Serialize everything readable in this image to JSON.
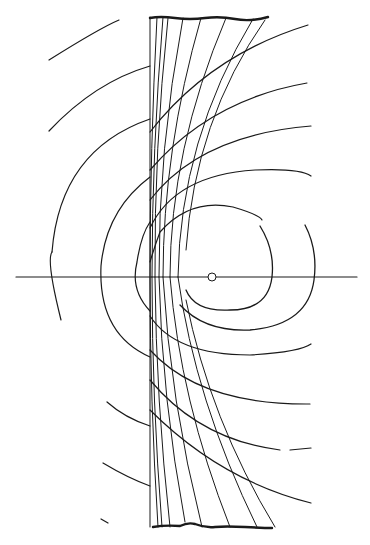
{
  "figure": {
    "type": "line-drawing",
    "background": "#ffffff",
    "ink": "#1a1a1a",
    "axis": {
      "y": 277,
      "x_start": 16,
      "x_end": 357
    },
    "source": {
      "cx": 212,
      "cy": 277,
      "r": 4
    },
    "plate": {
      "x_left": 150,
      "top_y": 17,
      "bottom_y": 527,
      "top_right_x": 268,
      "bottom_right_x": 272
    },
    "left_arcs": [
      {
        "d": "M49 60 Q100 28 119 20"
      },
      {
        "d": "M49 131 Q95 82 150 66"
      },
      {
        "d": "M52 252 Q60 150 150 119"
      },
      {
        "d": "M61 320 Q46 260 52 252"
      },
      {
        "d": "M150 357 Q98 334 101 266 Q106 210 150 177"
      },
      {
        "d": "M150 311 Q130 290 137 262 Q141 235 150 222"
      },
      {
        "d": "M107 402 Q125 418 150 426"
      },
      {
        "d": "M103 463 Q128 478 150 486"
      },
      {
        "d": "M101 519 L108 523"
      }
    ],
    "right_arcs": [
      {
        "d": "M150 262 Q155 245 160 232 Q190 198 233 207 Q260 215 262 220"
      },
      {
        "d": "M150 228 Q175 175 255 170 Q300 168 311 176"
      },
      {
        "d": "M150 200 Q200 135 311 126"
      },
      {
        "d": "M150 170 Q210 100 307 83"
      },
      {
        "d": "M150 132 Q210 55 308 25"
      },
      {
        "d": "M150 316 Q175 355 250 355 Q300 352 311 344"
      },
      {
        "d": "M150 350 Q200 405 310 404"
      },
      {
        "d": "M150 380 Q200 440 280 450"
      },
      {
        "d": "M290 450 L311 448"
      },
      {
        "d": "M150 410 Q220 480 311 503"
      }
    ],
    "near_circles": [
      {
        "cx": 212,
        "cy": 277,
        "rx": 33,
        "ry": 30
      },
      {
        "d": "M260 226 Q275 250 272 277 Q268 310 230 310 Q195 312 186 290"
      },
      {
        "d": "M305 225 Q318 250 314 280 Q308 325 250 330 Q205 332 180 305"
      }
    ],
    "plate_lines": [
      {
        "d": "M150 17 L150 527"
      },
      {
        "d": "M157 17 Q150 150 150 277 Q150 400 158 527"
      },
      {
        "d": "M163 17 Q152 150 152 277"
      },
      {
        "d": "M168 18 Q154 150 155 277"
      },
      {
        "d": "M183 18 Q158 150 159 277"
      },
      {
        "d": "M201 18 Q163 150 163 277"
      },
      {
        "d": "M226 18 Q170 150 170 277"
      },
      {
        "d": "M253 19 Q180 140 178 277"
      },
      {
        "d": "M265 20 Q195 120 186 250"
      },
      {
        "d": "M152 277 Q152 400 162 527"
      },
      {
        "d": "M155 277 Q156 400 170 527"
      },
      {
        "d": "M159 277 Q162 400 185 522"
      },
      {
        "d": "M163 277 Q170 400 202 527"
      },
      {
        "d": "M170 277 Q180 400 230 527"
      },
      {
        "d": "M178 277 Q195 400 257 527"
      },
      {
        "d": "M186 300 Q210 420 275 527"
      }
    ],
    "top_edge": {
      "d": "M150 18 Q160 16 175 18 T205 18 T235 19 T268 17"
    },
    "bottom_edge": {
      "d": "M153 527 Q165 525 180 526 Q188 522 195 524 Q205 528 215 527 T245 527 T272 528"
    }
  }
}
